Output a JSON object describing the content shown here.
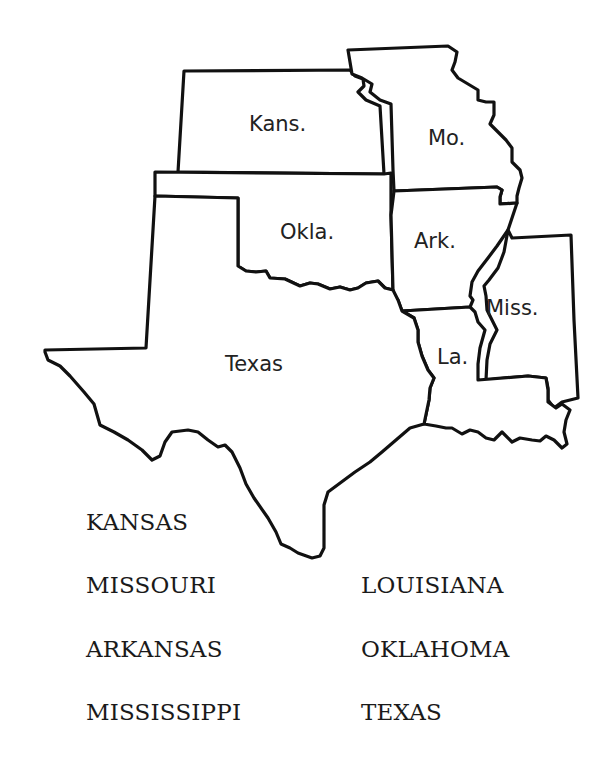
{
  "map": {
    "title": "",
    "labels": {
      "kansas": "Kans.",
      "missouri": "Mo.",
      "oklahoma": "Okla.",
      "arkansas": "Ark.",
      "mississippi": "Miss.",
      "louisiana": "La.",
      "texas": "Texas"
    }
  },
  "word_list": {
    "left_column": [
      "KANSAS",
      "MISSOURI",
      "ARKANSAS",
      "MISSISSIPPI"
    ],
    "right_column": [
      "LOUISIANA",
      "OKLAHOMA",
      "TEXAS"
    ]
  },
  "colors": {
    "line": "#111111",
    "background": "#ffffff",
    "text": "#1a1a1a"
  }
}
